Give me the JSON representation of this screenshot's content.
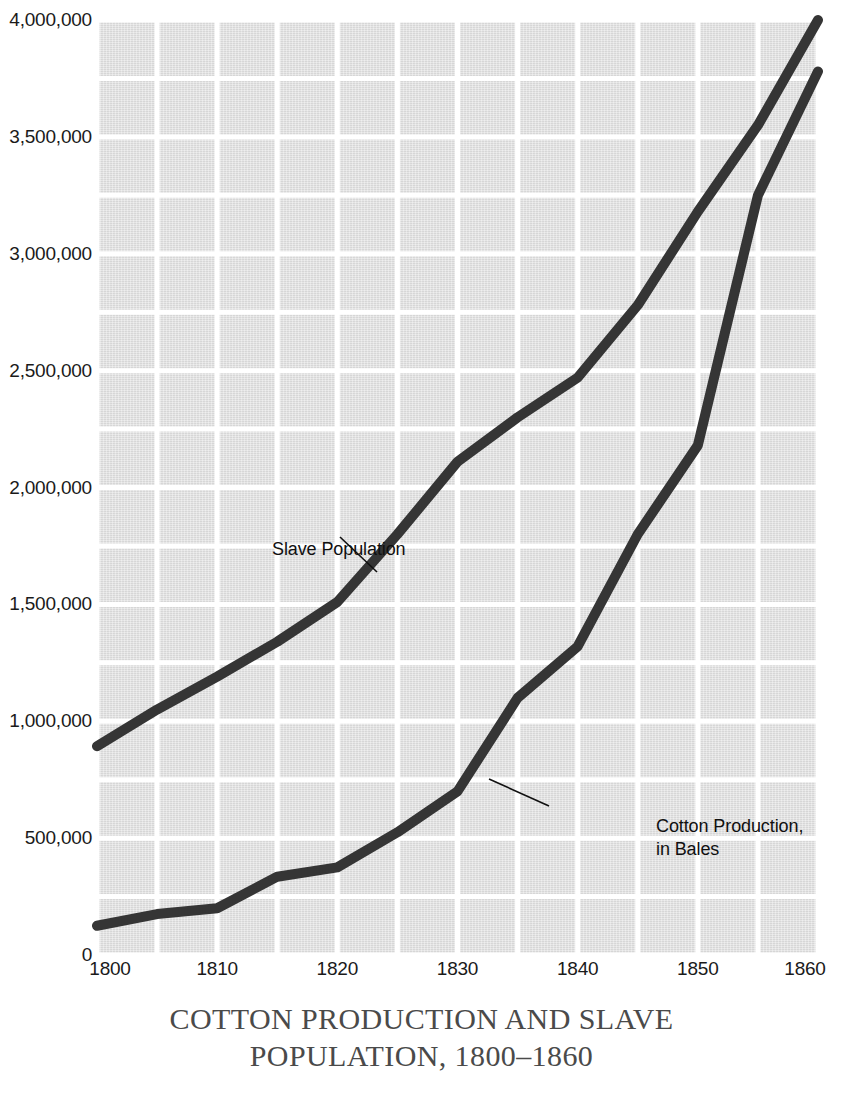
{
  "caption": {
    "line1": "COTTON PRODUCTION AND SLAVE",
    "line2": "POPULATION, 1800–1860"
  },
  "colors": {
    "plot_background": "#dcdcdc",
    "gridline": "#ffffff",
    "series_line": "#353535",
    "tick_text": "#1a1a1a",
    "caption_text": "#4a4a4a",
    "page_background": "#ffffff"
  },
  "annotations": {
    "slave_population": {
      "text": "Slave Population",
      "leader_from": [
        340,
        537
      ],
      "leader_to": [
        377,
        572
      ]
    },
    "cotton_production": {
      "text": "Cotton Production,\nin Bales",
      "leader_from": [
        549,
        806
      ],
      "leader_to": [
        489,
        779
      ]
    }
  },
  "chart_data": {
    "type": "line",
    "title": "COTTON PRODUCTION AND SLAVE POPULATION, 1800–1860",
    "xlabel": "",
    "ylabel": "",
    "xlim": [
      1800,
      1860
    ],
    "ylim": [
      0,
      4000000
    ],
    "xticks": [
      1800,
      1810,
      1820,
      1830,
      1840,
      1850,
      1860
    ],
    "xtick_labels": [
      "1800",
      "1810",
      "1820",
      "1830",
      "1840",
      "1850",
      "1860"
    ],
    "yticks": [
      0,
      500000,
      1000000,
      1500000,
      2000000,
      2500000,
      3000000,
      3500000,
      4000000
    ],
    "ytick_labels": [
      "0",
      "500,000",
      "1,000,000",
      "1,500,000",
      "2,000,000",
      "2,500,000",
      "3,000,000",
      "3,500,000",
      "4,000,000"
    ],
    "grid": true,
    "grid_x_step": 5,
    "grid_y_step": 250000,
    "legend": "inline-annotations",
    "x": [
      1800,
      1805,
      1810,
      1815,
      1820,
      1825,
      1830,
      1835,
      1840,
      1845,
      1850,
      1855,
      1860
    ],
    "series": [
      {
        "name": "Slave Population",
        "values": [
          893000,
          1050000,
          1191000,
          1340000,
          1510000,
          1800000,
          2110000,
          2300000,
          2470000,
          2780000,
          3180000,
          3550000,
          4000000
        ]
      },
      {
        "name": "Cotton Production, in Bales",
        "values": [
          125000,
          175000,
          200000,
          335000,
          375000,
          525000,
          700000,
          1100000,
          1320000,
          1800000,
          2180000,
          3250000,
          3780000
        ]
      }
    ]
  }
}
